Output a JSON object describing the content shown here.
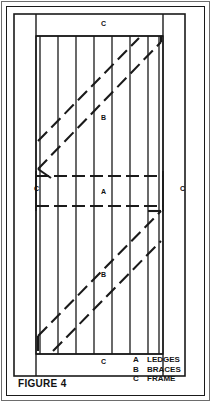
{
  "figure": {
    "caption": "FIGURE 4"
  },
  "legend": {
    "items": [
      {
        "key": "A",
        "text": "LEDGES"
      },
      {
        "key": "B",
        "text": "BRACES"
      },
      {
        "key": "C",
        "text": "FRAME"
      }
    ]
  },
  "callouts": {
    "frame_top": "C",
    "frame_left": "C",
    "frame_right": "C",
    "frame_bottom": "C",
    "ledges": "A",
    "brace_upper": "B",
    "brace_lower": "B"
  },
  "colors": {
    "ink": "#1a1a1a",
    "page_rule": "#6d6d6d",
    "paper": "#ffffff"
  },
  "diagram": {
    "type": "technical-line-drawing",
    "outer_frame": {
      "x": 14,
      "y": 14,
      "w": 171,
      "h": 362
    },
    "stile_width": 22,
    "rail_height": 22,
    "board_count": 7,
    "board_edges_x": [
      36,
      55,
      74,
      93,
      112,
      131,
      150,
      163
    ],
    "ledges_y": [
      176,
      206
    ],
    "braces": [
      {
        "name": "upper",
        "from": [
          38,
          165
        ],
        "to": [
          161,
          40
        ]
      },
      {
        "name": "upper-2",
        "from": [
          38,
          165
        ],
        "to": [
          161,
          40
        ],
        "offset": 30
      },
      {
        "name": "lower",
        "from": [
          38,
          330
        ],
        "to": [
          161,
          207
        ]
      },
      {
        "name": "lower-2",
        "from": [
          38,
          330
        ],
        "to": [
          161,
          207
        ],
        "offset": 30
      }
    ]
  }
}
